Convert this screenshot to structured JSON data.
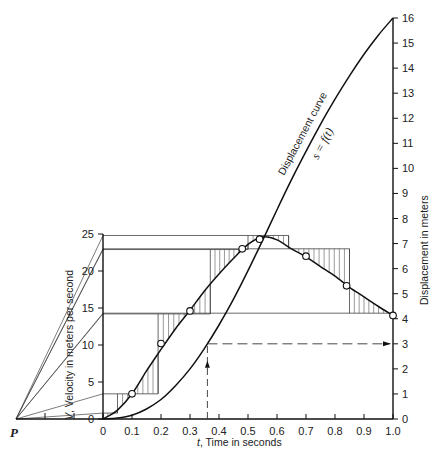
{
  "figure": {
    "pole_label": "P",
    "x_axis": {
      "label_var": "t",
      "label_text": ", Time in seconds",
      "range": [
        0,
        1.0
      ],
      "ticks": [
        "0",
        "0.1",
        "0.2",
        "0.3",
        "0.4",
        "0.5",
        "0.6",
        "0.7",
        "0.8",
        "0.9",
        "1.0"
      ]
    },
    "velocity_axis": {
      "label_var": "V",
      "label_text": ", Velocity in meters per second",
      "range": [
        0,
        25
      ],
      "ticks": [
        "0",
        "5",
        "10",
        "15",
        "20",
        "25"
      ]
    },
    "displacement_axis": {
      "label": "Displacement in meters",
      "range": [
        0,
        16
      ],
      "ticks": [
        "0",
        "1",
        "2",
        "3",
        "4",
        "5",
        "6",
        "7",
        "8",
        "9",
        "10",
        "11",
        "12",
        "13",
        "14",
        "15",
        "16"
      ]
    },
    "annotations": {
      "curve_name": "Displacement curve",
      "curve_eq": "s = f(t)"
    },
    "example_readout": {
      "t": 0.36,
      "s": 3
    }
  },
  "chart_data": {
    "type": "line",
    "title": "",
    "xlabel": "t, Time in seconds",
    "ylabel_left": "V, Velocity in meters per second",
    "ylabel_right": "Displacement in meters",
    "xlim": [
      0,
      1.0
    ],
    "ylim_left": [
      0,
      25
    ],
    "ylim_right": [
      0,
      16
    ],
    "series": [
      {
        "name": "Velocity measured points",
        "axis": "left",
        "marker": "circle",
        "x": [
          0.1,
          0.2,
          0.3,
          0.48,
          0.54,
          0.7,
          0.84,
          1.0
        ],
        "y": [
          3.4,
          10.2,
          14.6,
          23.0,
          24.3,
          22.0,
          18.0,
          14.0
        ]
      },
      {
        "name": "Velocity curve",
        "axis": "left",
        "x": [
          0,
          0.05,
          0.1,
          0.15,
          0.2,
          0.25,
          0.3,
          0.35,
          0.4,
          0.45,
          0.5,
          0.55,
          0.6,
          0.65,
          0.7,
          0.75,
          0.8,
          0.85,
          0.9,
          0.95,
          1.0
        ],
        "y": [
          0,
          1.2,
          3.4,
          6.5,
          9.4,
          12.2,
          14.7,
          17.3,
          19.6,
          21.7,
          23.6,
          24.6,
          24.2,
          23.0,
          21.9,
          20.6,
          19.3,
          17.8,
          16.5,
          15.2,
          14.0
        ]
      },
      {
        "name": "Step approximation (average velocity)",
        "axis": "left",
        "steps": [
          {
            "t0": 0.0,
            "t1": 0.05,
            "v": 0.8
          },
          {
            "t0": 0.05,
            "t1": 0.19,
            "v": 3.4
          },
          {
            "t0": 0.19,
            "t1": 0.37,
            "v": 14.2
          },
          {
            "t0": 0.37,
            "t1": 0.5,
            "v": 22.9
          },
          {
            "t0": 0.5,
            "t1": 0.64,
            "v": 24.8
          },
          {
            "t0": 0.64,
            "t1": 0.85,
            "v": 23.0
          },
          {
            "t0": 0.85,
            "t1": 1.0,
            "v": 14.3
          }
        ]
      },
      {
        "name": "Displacement curve s = f(t)",
        "axis": "right",
        "x": [
          0,
          0.05,
          0.1,
          0.15,
          0.2,
          0.25,
          0.3,
          0.35,
          0.4,
          0.45,
          0.5,
          0.55,
          0.6,
          0.65,
          0.7,
          0.75,
          0.8,
          0.85,
          0.9,
          0.95,
          1.0
        ],
        "y": [
          0,
          0.04,
          0.15,
          0.4,
          0.78,
          1.33,
          2.0,
          2.82,
          3.75,
          4.78,
          5.92,
          7.12,
          8.35,
          9.55,
          10.68,
          11.76,
          12.76,
          13.69,
          14.55,
          15.32,
          16.0
        ]
      }
    ],
    "grid": false
  }
}
